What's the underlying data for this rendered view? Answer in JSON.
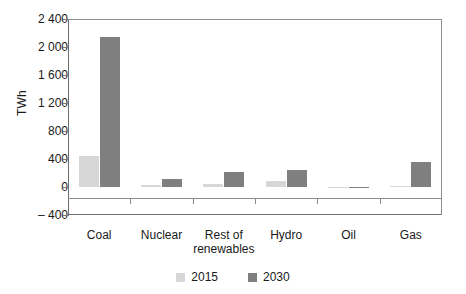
{
  "chart_data": {
    "type": "bar",
    "title": "",
    "subtitle": "",
    "xlabel": "",
    "ylabel": "TWh",
    "categories": [
      "Coal",
      "Nuclear",
      "Rest of\nrenewables",
      "Hydro",
      "Oil",
      "Gas"
    ],
    "category_labels": [
      {
        "line1": "Coal",
        "line2": ""
      },
      {
        "line1": "Nuclear",
        "line2": ""
      },
      {
        "line1": "Rest of",
        "line2": "renewables"
      },
      {
        "line1": "Hydro",
        "line2": ""
      },
      {
        "line1": "Oil",
        "line2": ""
      },
      {
        "line1": "Gas",
        "line2": ""
      }
    ],
    "series": [
      {
        "name": "2015",
        "color": "#d7d7d7",
        "values": [
          440,
          30,
          40,
          90,
          0,
          10
        ]
      },
      {
        "name": "2030",
        "color": "#7f7f7f",
        "values": [
          2150,
          120,
          210,
          240,
          5,
          360
        ]
      }
    ],
    "ylim": [
      -400,
      2400
    ],
    "ytick_values": [
      2400,
      2000,
      1600,
      1200,
      800,
      400,
      0,
      -400
    ],
    "ytick_labels": [
      "2 400",
      "2 000",
      "1 600",
      "1 200",
      "800",
      "400",
      "0",
      "– 400"
    ],
    "grid": false,
    "legend_position": "bottom-center",
    "legend": [
      {
        "label": "2015",
        "color": "#d7d7d7"
      },
      {
        "label": "2030",
        "color": "#7f7f7f"
      }
    ]
  },
  "axis": {
    "y_title": "TWh"
  }
}
